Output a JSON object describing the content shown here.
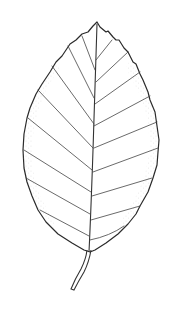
{
  "image": {
    "subject": "leaf",
    "style": "botanical line drawing",
    "background": "#ffffff",
    "line_color": "#2a2a2a"
  }
}
